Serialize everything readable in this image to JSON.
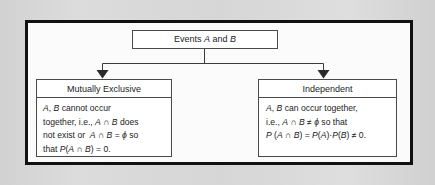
{
  "figure": {
    "type": "tree-diagram",
    "frame_color": "#111111",
    "page_background": "#d8d8d8",
    "panel_background": "#fbfbfb",
    "line_color": "#3a3a3a"
  },
  "root": {
    "label": "Events A and B",
    "label_parts": {
      "prefix": "Events ",
      "var1": "A",
      "conjunction": " and ",
      "var2": "B"
    }
  },
  "branches": [
    {
      "id": "mutually-exclusive",
      "header": "Mutually Exclusive",
      "lines": [
        "A, B cannot occur",
        "together, i.e., A ∩ B does",
        "not exist or  A ∩ B = ϕ so",
        "that P(A ∩ B) = 0."
      ]
    },
    {
      "id": "independent",
      "header": "Independent",
      "lines": [
        "A, B can occur together,",
        "i.e., A ∩ B ≠ ϕ so that",
        "P (A ∩ B) = P(A)·P(B) ≠ 0."
      ]
    }
  ],
  "symbols": {
    "intersection": "∩",
    "empty_set": "ϕ",
    "not_equal": "≠",
    "dot_operator": "·"
  },
  "connectors": {
    "trunk_y": 63,
    "left_arrow_x": 102,
    "right_arrow_x": 323,
    "arrow_tip_y": 78
  }
}
